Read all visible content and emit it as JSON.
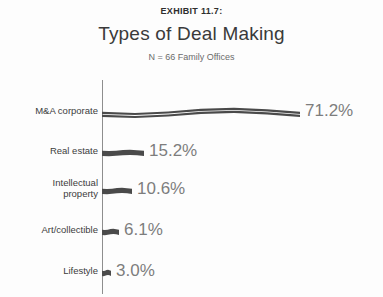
{
  "header": {
    "exhibit_label": "EXHIBIT 11.7:",
    "title": "Types of Deal Making",
    "subtitle": "N = 66 Family Offices"
  },
  "colors": {
    "bar": "#4a4a4a",
    "axis": "#8e8e8e",
    "value_label": "#7d7d7d",
    "category_label": "#3c3c3c",
    "title": "#3a3a3a",
    "background": "#fdfdfd"
  },
  "chart_data": {
    "type": "bar",
    "orientation": "horizontal",
    "title": "Types of Deal Making",
    "subtitle": "N = 66 Family Offices",
    "exhibit": "EXHIBIT 11.7:",
    "xlabel": "",
    "ylabel": "",
    "xlim": [
      0,
      71.2
    ],
    "grid": false,
    "legend": false,
    "value_suffix": "%",
    "categories": [
      "M&A corporate",
      "Real estate",
      "Intellectual property",
      "Art/collectible",
      "Lifestyle"
    ],
    "values": [
      71.2,
      15.2,
      10.6,
      6.1,
      3.0
    ],
    "value_labels": [
      "71.2%",
      "15.2%",
      "10.6%",
      "6.1%",
      "3.0%"
    ],
    "bars": [
      {
        "category": "M&A corporate",
        "category_line1": "M&A corporate",
        "category_line2": "",
        "value": 71.2,
        "label": "71.2%",
        "width_px": 198
      },
      {
        "category": "Real estate",
        "category_line1": "Real estate",
        "category_line2": "",
        "value": 15.2,
        "label": "15.2%",
        "width_px": 42
      },
      {
        "category": "Intellectual property",
        "category_line1": "Intellectual",
        "category_line2": "property",
        "value": 10.6,
        "label": "10.6%",
        "width_px": 30
      },
      {
        "category": "Art/collectible",
        "category_line1": "Art/collectible",
        "category_line2": "",
        "value": 6.1,
        "label": "6.1%",
        "width_px": 17
      },
      {
        "category": "Lifestyle",
        "category_line1": "Lifestyle",
        "category_line2": "",
        "value": 3.0,
        "label": "3.0%",
        "width_px": 9
      }
    ]
  }
}
